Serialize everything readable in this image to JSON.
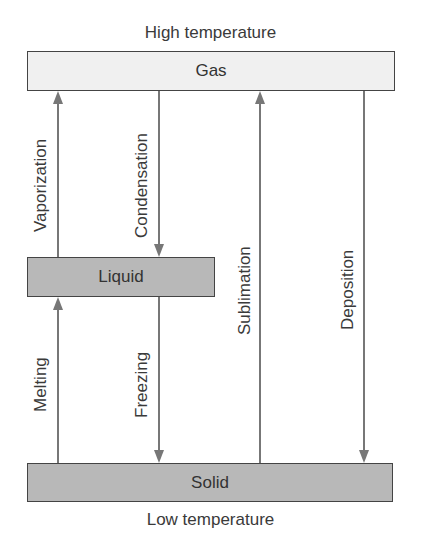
{
  "captions": {
    "top": "High temperature",
    "bottom": "Low temperature"
  },
  "states": {
    "gas": "Gas",
    "liquid": "Liquid",
    "solid": "Solid"
  },
  "transitions": {
    "vaporization": "Vaporization",
    "condensation": "Condensation",
    "melting": "Melting",
    "freezing": "Freezing",
    "sublimation": "Sublimation",
    "deposition": "Deposition"
  },
  "colors": {
    "gas_fill": "#f0f0f0",
    "liquid_fill": "#b8b8b8",
    "solid_fill": "#b8b8b8",
    "arrow": "#777777",
    "border": "#444444"
  }
}
